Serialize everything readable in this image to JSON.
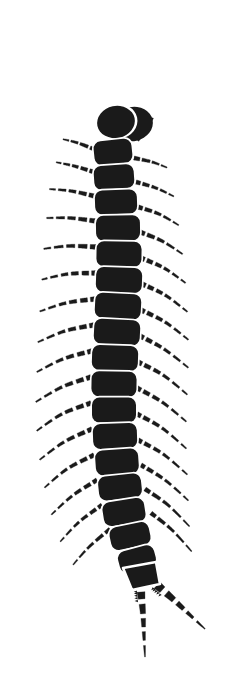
{
  "figure": {
    "title": "Centipede",
    "subject": "centipede",
    "style": "black silhouette line illustration",
    "background_color": "#ffffff",
    "ink_color": "#1a1a1a",
    "canvas": {
      "width": 230,
      "height": 691
    },
    "orientation": "vertical, head at top, tail at bottom"
  },
  "anatomy": {
    "head": {
      "label": "head",
      "cx": 116,
      "cy": 122,
      "rx": 19,
      "ry": 16,
      "rotation": -12,
      "crescent": {
        "label": "head-crescent",
        "cx": 133,
        "cy": 124,
        "rx": 20,
        "ry": 17,
        "rotation": -12
      }
    },
    "antennae": [
      {
        "label": "antenna-right",
        "direction": "up-right",
        "points": "119,108 123,88 128,68 134,50 139,38",
        "base_width": 5.4,
        "tip_width": 0.8,
        "dash_count": 9
      },
      {
        "label": "antenna-left",
        "direction": "up-left",
        "points": "101,116 86,105 70,96 54,90 33,87 24,86",
        "base_width": 5.0,
        "tip_width": 0.9,
        "dash_count": 11
      }
    ],
    "maxilliped": {
      "label": "maxilliped",
      "points": "137,140 146,128 153,118",
      "base_width": 4.5,
      "tip_width": 1.2
    },
    "body_segments": [
      {
        "index": 1,
        "cx": 113,
        "cy": 152,
        "w": 38,
        "h": 24,
        "rot": -6
      },
      {
        "index": 2,
        "cx": 114,
        "cy": 177,
        "w": 40,
        "h": 24,
        "rot": -4
      },
      {
        "index": 3,
        "cx": 116,
        "cy": 202,
        "w": 42,
        "h": 24,
        "rot": -2
      },
      {
        "index": 4,
        "cx": 118,
        "cy": 228,
        "w": 44,
        "h": 25,
        "rot": -1
      },
      {
        "index": 5,
        "cx": 119,
        "cy": 254,
        "w": 45,
        "h": 25,
        "rot": 1
      },
      {
        "index": 6,
        "cx": 119,
        "cy": 280,
        "w": 46,
        "h": 25,
        "rot": 2
      },
      {
        "index": 7,
        "cx": 118,
        "cy": 306,
        "w": 46,
        "h": 25,
        "rot": 3
      },
      {
        "index": 8,
        "cx": 117,
        "cy": 332,
        "w": 46,
        "h": 25,
        "rot": 3
      },
      {
        "index": 9,
        "cx": 115,
        "cy": 358,
        "w": 46,
        "h": 25,
        "rot": 2
      },
      {
        "index": 10,
        "cx": 114,
        "cy": 384,
        "w": 45,
        "h": 25,
        "rot": 1
      },
      {
        "index": 11,
        "cx": 114,
        "cy": 410,
        "w": 44,
        "h": 25,
        "rot": 0
      },
      {
        "index": 12,
        "cx": 115,
        "cy": 436,
        "w": 44,
        "h": 25,
        "rot": -2
      },
      {
        "index": 13,
        "cx": 117,
        "cy": 462,
        "w": 43,
        "h": 25,
        "rot": -4
      },
      {
        "index": 14,
        "cx": 120,
        "cy": 487,
        "w": 43,
        "h": 24,
        "rot": -6
      },
      {
        "index": 15,
        "cx": 124,
        "cy": 512,
        "w": 42,
        "h": 24,
        "rot": -9
      },
      {
        "index": 16,
        "cx": 130,
        "cy": 536,
        "w": 40,
        "h": 23,
        "rot": -12
      },
      {
        "index": 17,
        "cx": 137,
        "cy": 559,
        "w": 37,
        "h": 22,
        "rot": -15
      }
    ],
    "terminal_segment": {
      "label": "terminal-segment",
      "path": "M 123,568 L 156,562 L 160,584 L 132,590 Z"
    },
    "legs_left": [
      {
        "index": 1,
        "points": "96,150 78,143 62,139",
        "dashes": 4,
        "base_w": 4.2
      },
      {
        "index": 2,
        "points": "94,172 74,166 55,162",
        "dashes": 5,
        "base_w": 4.4
      },
      {
        "index": 3,
        "points": "94,196 71,191 48,189",
        "dashes": 5,
        "base_w": 4.6
      },
      {
        "index": 4,
        "points": "95,221 70,218 45,218",
        "dashes": 5,
        "base_w": 4.8
      },
      {
        "index": 5,
        "points": "96,247 69,246 42,249",
        "dashes": 5,
        "base_w": 5.0
      },
      {
        "index": 6,
        "points": "96,273 68,274 40,280",
        "dashes": 6,
        "base_w": 5.0
      },
      {
        "index": 7,
        "points": "95,299 66,303 38,312",
        "dashes": 6,
        "base_w": 5.0
      },
      {
        "index": 8,
        "points": "94,325 65,331 36,343",
        "dashes": 6,
        "base_w": 5.0
      },
      {
        "index": 9,
        "points": "92,351 63,359 35,373",
        "dashes": 6,
        "base_w": 5.0
      },
      {
        "index": 10,
        "points": "91,377 62,387 34,403",
        "dashes": 6,
        "base_w": 5.0
      },
      {
        "index": 11,
        "points": "91,403 62,414 35,432",
        "dashes": 6,
        "base_w": 4.9
      },
      {
        "index": 12,
        "points": "92,429 64,442 38,461",
        "dashes": 6,
        "base_w": 4.8
      },
      {
        "index": 13,
        "points": "94,455 67,469 43,489",
        "dashes": 6,
        "base_w": 4.7
      },
      {
        "index": 14,
        "points": "97,480 72,496 50,516",
        "dashes": 6,
        "base_w": 4.5
      },
      {
        "index": 15,
        "points": "102,505 79,522 59,543",
        "dashes": 6,
        "base_w": 4.3
      },
      {
        "index": 16,
        "points": "110,529 89,547 72,566",
        "dashes": 5,
        "base_w": 4.0
      }
    ],
    "legs_right": [
      {
        "index": 1,
        "points": "134,158 152,162 168,168",
        "dashes": 4,
        "base_w": 4.2
      },
      {
        "index": 2,
        "points": "136,182 156,188 175,197",
        "dashes": 5,
        "base_w": 4.4
      },
      {
        "index": 3,
        "points": "138,207 159,214 180,226",
        "dashes": 5,
        "base_w": 4.6
      },
      {
        "index": 4,
        "points": "140,232 162,241 184,255",
        "dashes": 5,
        "base_w": 4.8
      },
      {
        "index": 5,
        "points": "141,258 164,268 187,284",
        "dashes": 6,
        "base_w": 5.0
      },
      {
        "index": 6,
        "points": "142,284 165,295 189,313",
        "dashes": 6,
        "base_w": 5.0
      },
      {
        "index": 7,
        "points": "141,310 165,322 190,341",
        "dashes": 6,
        "base_w": 5.0
      },
      {
        "index": 8,
        "points": "140,336 164,349 190,369",
        "dashes": 6,
        "base_w": 5.0
      },
      {
        "index": 9,
        "points": "138,362 163,375 189,396",
        "dashes": 6,
        "base_w": 5.0
      },
      {
        "index": 10,
        "points": "137,388 162,402 188,423",
        "dashes": 6,
        "base_w": 4.9
      },
      {
        "index": 11,
        "points": "137,414 162,428 188,450",
        "dashes": 6,
        "base_w": 4.8
      },
      {
        "index": 12,
        "points": "138,440 163,454 189,476",
        "dashes": 6,
        "base_w": 4.7
      },
      {
        "index": 13,
        "points": "141,465 165,480 190,502",
        "dashes": 6,
        "base_w": 4.6
      },
      {
        "index": 14,
        "points": "145,489 168,505 191,528",
        "dashes": 5,
        "base_w": 4.4
      },
      {
        "index": 15,
        "points": "151,513 172,530 193,553",
        "dashes": 5,
        "base_w": 4.2
      }
    ],
    "cerci": [
      {
        "label": "cercus-center",
        "direction": "down",
        "points": "141,592 143,614 144,636 145,657",
        "base_width": 8,
        "tip_width": 0.8,
        "segments": 5,
        "serrated": true
      },
      {
        "label": "cercus-right",
        "direction": "down-right",
        "points": "157,585 174,600 190,615 205,629",
        "base_width": 9,
        "tip_width": 0.8,
        "segments": 5,
        "serrated": true
      }
    ]
  }
}
